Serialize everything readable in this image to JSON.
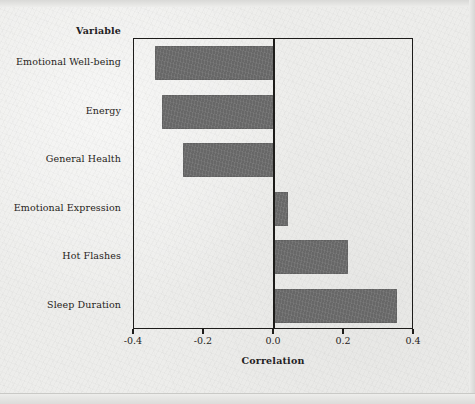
{
  "figure": {
    "variable_header": "Variable",
    "x_axis_title": "Correlation"
  },
  "chart_data": {
    "type": "bar",
    "orientation": "horizontal",
    "title": "",
    "xlabel": "Correlation",
    "ylabel": "Variable",
    "xlim": [
      -0.4,
      0.4
    ],
    "xticks": [
      -0.4,
      -0.2,
      0.0,
      0.2,
      0.4
    ],
    "xticklabels": [
      "-0.4",
      "-0.2",
      "0.0",
      "0.2",
      "0.4"
    ],
    "grid": false,
    "legend": false,
    "zero_reference_line": 0.0,
    "bar_color": "#6e6e6e",
    "background_color": "#ededeb",
    "axis_color": "#1d1c1a",
    "categories": [
      "Emotional Well-being",
      "Energy",
      "General Health",
      "Emotional Expression",
      "Hot Flashes",
      "Sleep Duration"
    ],
    "values": [
      -0.34,
      -0.32,
      -0.26,
      0.04,
      0.21,
      0.35
    ],
    "bars": [
      {
        "label": "Emotional Well-being",
        "value": -0.34
      },
      {
        "label": "Energy",
        "value": -0.32
      },
      {
        "label": "General Health",
        "value": -0.26
      },
      {
        "label": "Emotional Expression",
        "value": 0.04
      },
      {
        "label": "Hot Flashes",
        "value": 0.21
      },
      {
        "label": "Sleep Duration",
        "value": 0.35
      }
    ]
  }
}
